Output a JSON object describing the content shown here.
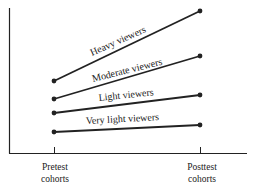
{
  "chart_data": {
    "type": "line",
    "title": "",
    "xlabel": "",
    "ylabel": "",
    "categories": [
      "Pretest cohorts",
      "Posttest cohorts"
    ],
    "x_tick_labels": [
      [
        "Pretest",
        "cohorts"
      ],
      [
        "Posttest",
        "cohorts"
      ]
    ],
    "grid": false,
    "legend": "inline labels above lines",
    "y_axis_ticks": "none",
    "series": [
      {
        "name": "Heavy viewers",
        "values": [
          4.0,
          7.6
        ],
        "px": [
          [
            54,
            81
          ],
          [
            200,
            11
          ]
        ]
      },
      {
        "name": "Moderate viewers",
        "values": [
          2.9,
          5.2
        ],
        "px": [
          [
            54,
            99
          ],
          [
            200,
            56
          ]
        ]
      },
      {
        "name": "Light viewers",
        "values": [
          2.1,
          3.0
        ],
        "px": [
          [
            54,
            113
          ],
          [
            200,
            95
          ]
        ]
      },
      {
        "name": "Very light viewers",
        "values": [
          1.1,
          1.5
        ],
        "px": [
          [
            54,
            132
          ],
          [
            200,
            125
          ]
        ]
      }
    ],
    "labels": {
      "heavy": "Heavy viewers",
      "moderate": "Moderate viewers",
      "light": "Light viewers",
      "very_light": "Very light viewers",
      "pre_1": "Pretest",
      "pre_2": "cohorts",
      "post_1": "Posttest",
      "post_2": "cohorts"
    }
  }
}
